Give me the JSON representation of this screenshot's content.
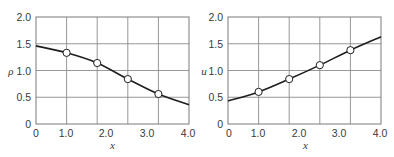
{
  "chart_data": [
    {
      "type": "line",
      "title": "",
      "xlabel": "x",
      "ylabel": "ρ",
      "xlim": [
        0,
        4.0
      ],
      "ylim": [
        0,
        2.0
      ],
      "x_ticks": [
        "0",
        "1.0",
        "2.0",
        "3.0",
        "4.0"
      ],
      "y_ticks": [
        "0",
        "0.5",
        "1.0",
        "1.5",
        "2.0"
      ],
      "grid": true,
      "curve": {
        "x": [
          0,
          0.8,
          1.6,
          2.4,
          3.2,
          4.0
        ],
        "y": [
          1.46,
          1.33,
          1.14,
          0.84,
          0.56,
          0.36
        ]
      },
      "markers": {
        "style": "open-circle",
        "x": [
          0.8,
          1.6,
          2.4,
          3.2
        ],
        "y": [
          1.33,
          1.14,
          0.84,
          0.56
        ]
      }
    },
    {
      "type": "line",
      "title": "",
      "xlabel": "x",
      "ylabel": "u",
      "xlim": [
        0,
        4.0
      ],
      "ylim": [
        0,
        2.0
      ],
      "x_ticks": [
        "0",
        "1.0",
        "2.0",
        "3.0",
        "4.0"
      ],
      "y_ticks": [
        "0",
        "0.5",
        "1.0",
        "1.5",
        "2.0"
      ],
      "grid": true,
      "curve": {
        "x": [
          0,
          0.8,
          1.6,
          2.4,
          3.2,
          4.0
        ],
        "y": [
          0.43,
          0.6,
          0.84,
          1.1,
          1.38,
          1.63
        ]
      },
      "markers": {
        "style": "open-circle",
        "x": [
          0.8,
          1.6,
          2.4,
          3.2
        ],
        "y": [
          0.6,
          0.84,
          1.1,
          1.38
        ]
      }
    }
  ],
  "style": {
    "line_color": "#1e1e1e",
    "grid_color": "#8c8c8c",
    "frame_color": "#7a7a7a",
    "marker_fill": "#ffffff",
    "text_color": "#3a3a3a"
  }
}
